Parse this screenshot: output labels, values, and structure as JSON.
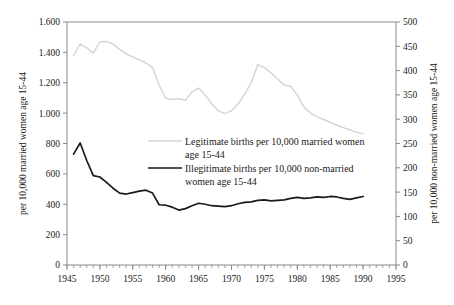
{
  "chart_data": {
    "type": "line",
    "title": "",
    "xlabel": "",
    "ylabel": "per 10,000 married women age 15-44",
    "y2label": "per 10,000 non-married women age 15-44",
    "grid": false,
    "legend_position": "inside-center",
    "xlim": [
      1945,
      1995
    ],
    "ylim": [
      0,
      1600
    ],
    "y2lim": [
      0,
      500
    ],
    "x_major_ticks": [
      1945,
      1950,
      1955,
      1960,
      1965,
      1970,
      1975,
      1980,
      1985,
      1990,
      1995
    ],
    "x_tick_labels": [
      "1945",
      "1950",
      "1955",
      "1960",
      "1965",
      "1970",
      "1975",
      "1980",
      "1985",
      "1990",
      "1995"
    ],
    "x_minor_tick_step": 1,
    "y_ticks": [
      0,
      200,
      400,
      600,
      800,
      1000,
      1200,
      1400,
      1600
    ],
    "y_tick_labels": [
      "0",
      "200",
      "400",
      "600",
      "800",
      "1.000",
      "1.200",
      "1.400",
      "1.600"
    ],
    "y2_ticks": [
      0,
      50,
      100,
      150,
      200,
      250,
      300,
      350,
      400,
      450,
      500
    ],
    "y2_tick_labels": [
      "0",
      "50",
      "100",
      "150",
      "200",
      "250",
      "300",
      "350",
      "400",
      "450",
      "500"
    ],
    "series": [
      {
        "name": "Legitimate births per 10,000 married women age 15-44",
        "legend_label_line1": "Legitimate births per 10,000 married women",
        "legend_label_line2": "age 15-44",
        "axis": "left",
        "color": "#d4d4d4",
        "x": [
          1946,
          1947,
          1948,
          1949,
          1950,
          1951,
          1952,
          1953,
          1954,
          1955,
          1956,
          1957,
          1958,
          1959,
          1960,
          1961,
          1962,
          1963,
          1964,
          1965,
          1966,
          1967,
          1968,
          1969,
          1970,
          1971,
          1972,
          1973,
          1974,
          1975,
          1976,
          1977,
          1978,
          1979,
          1980,
          1981,
          1982,
          1983,
          1984,
          1985,
          1986,
          1987,
          1988,
          1989,
          1990
        ],
        "values": [
          1380,
          1455,
          1430,
          1395,
          1470,
          1472,
          1455,
          1420,
          1390,
          1370,
          1350,
          1330,
          1300,
          1185,
          1098,
          1090,
          1095,
          1085,
          1140,
          1165,
          1120,
          1060,
          1015,
          998,
          1015,
          1060,
          1125,
          1200,
          1320,
          1300,
          1265,
          1225,
          1185,
          1175,
          1120,
          1040,
          1000,
          975,
          958,
          940,
          920,
          905,
          890,
          875,
          865
        ]
      },
      {
        "name": "Illegitimate births per 10,000 non-married women age 15-44",
        "legend_label_line1": "Illegitimate births per 10,000 non-married",
        "legend_label_line2": "women age 15-44",
        "axis": "right",
        "color": "#1a1a1a",
        "x": [
          1946,
          1947,
          1948,
          1949,
          1950,
          1951,
          1952,
          1953,
          1954,
          1955,
          1956,
          1957,
          1958,
          1959,
          1960,
          1961,
          1962,
          1963,
          1964,
          1965,
          1966,
          1967,
          1968,
          1969,
          1970,
          1971,
          1972,
          1973,
          1974,
          1975,
          1976,
          1977,
          1978,
          1979,
          1980,
          1981,
          1982,
          1983,
          1984,
          1985,
          1986,
          1987,
          1988,
          1989,
          1990
        ],
        "values": [
          228,
          251,
          215,
          184,
          181,
          170,
          158,
          148,
          146,
          149,
          152,
          154,
          148,
          124,
          123,
          119,
          113,
          116,
          122,
          127,
          125,
          122,
          121,
          120,
          122,
          126,
          129,
          130,
          133,
          134,
          132,
          133,
          134,
          137,
          139,
          137,
          138,
          140,
          139,
          141,
          140,
          137,
          135,
          138,
          141
        ]
      }
    ]
  },
  "axes": {
    "left_title": "per 10,000 married women age 15-44",
    "right_title": "per 10,000 non-married women age 15-44"
  }
}
